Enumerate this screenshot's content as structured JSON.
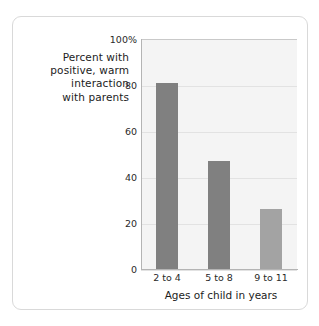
{
  "card": {
    "border_color": "#d9d9d9",
    "background": "#ffffff"
  },
  "y_axis_caption": {
    "lines": [
      "Percent with",
      "positive, warm",
      "interaction",
      "with parents"
    ]
  },
  "chart_data": {
    "type": "bar",
    "title": "",
    "subtitle": "",
    "categories": [
      "2 to 4",
      "5 to 8",
      "9 to 11"
    ],
    "values": [
      81,
      47,
      26
    ],
    "xlabel": "Ages of child in years",
    "ylabel": "Percent with positive, warm interaction with parents",
    "ylim": [
      0,
      100
    ],
    "ytick_labels": [
      "0",
      "20",
      "40",
      "60",
      "80",
      "100%"
    ],
    "ytick_values": [
      0,
      20,
      40,
      60,
      80,
      100
    ],
    "grid": true,
    "grid_color": "#e2e2e2",
    "legend": "none",
    "plot_background": "#f4f4f4",
    "bar_colors": [
      "#808080",
      "#808080",
      "#a3a3a3"
    ],
    "series": [
      {
        "name": "Percent with positive, warm interaction with parents",
        "values": [
          81,
          47,
          26
        ]
      }
    ]
  }
}
